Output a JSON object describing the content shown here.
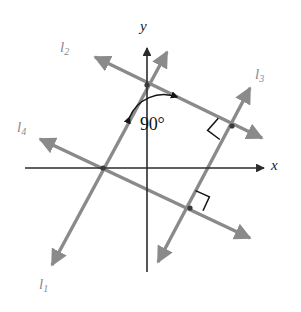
{
  "figure": {
    "kind": "coordinate-geometry-diagram",
    "background_color": "#ffffff",
    "width": 301,
    "height": 312
  },
  "axes": {
    "color": "#333333",
    "x_axis": {
      "label": "x",
      "label_position": {
        "x": 271,
        "y": 157
      },
      "start": {
        "x": 25,
        "y": 168
      },
      "end": {
        "x": 264,
        "y": 168
      },
      "arrow_at_end": true
    },
    "y_axis": {
      "label": "y",
      "label_position": {
        "x": 140,
        "y": 18
      },
      "start": {
        "x": 147,
        "y": 272
      },
      "end": {
        "x": 147,
        "y": 48
      },
      "arrow_at_end": true
    },
    "origin": {
      "x": 147,
      "y": 168
    }
  },
  "lines": [
    {
      "id": "l1",
      "label": "l",
      "subscript": "1",
      "color": "#8a8a8a",
      "label_position": {
        "x": 39,
        "y": 276
      },
      "from": {
        "x": 167,
        "y": 52
      },
      "to": {
        "x": 52,
        "y": 265
      },
      "arrow_both_ends": true
    },
    {
      "id": "l2",
      "label": "l",
      "subscript": "2",
      "color": "#8a8a8a",
      "label_position": {
        "x": 60,
        "y": 39
      },
      "from": {
        "x": 95,
        "y": 57
      },
      "to": {
        "x": 262,
        "y": 138
      },
      "arrow_both_ends": true
    },
    {
      "id": "l3",
      "label": "l",
      "subscript": "3",
      "color": "#8a8a8a",
      "label_position": {
        "x": 255,
        "y": 66
      },
      "from": {
        "x": 250,
        "y": 88
      },
      "to": {
        "x": 158,
        "y": 262
      },
      "arrow_both_ends": true
    },
    {
      "id": "l4",
      "label": "l",
      "subscript": "4",
      "color": "#8a8a8a",
      "label_position": {
        "x": 17,
        "y": 119
      },
      "from": {
        "x": 40,
        "y": 139
      },
      "to": {
        "x": 250,
        "y": 238
      },
      "arrow_both_ends": true
    }
  ],
  "intersection_points": [
    {
      "name": "l1-l2-on-y-axis",
      "x": 147,
      "y": 85,
      "dot": true
    },
    {
      "name": "l1-l4-on-x-axis",
      "x": 103,
      "y": 168,
      "dot": true
    },
    {
      "name": "l2-l3",
      "x": 232,
      "y": 126,
      "dot": true
    },
    {
      "name": "l3-l4",
      "x": 190,
      "y": 208,
      "dot": true
    }
  ],
  "angle_markers": [
    {
      "name": "angle-90-l1-l2",
      "type": "arc",
      "text": "90°",
      "vertex": {
        "x": 147,
        "y": 85
      },
      "text_position": {
        "x": 140,
        "y": 114
      },
      "arrow_on_arc": true,
      "color": "#141414"
    },
    {
      "name": "right-angle-l2-l3",
      "type": "square",
      "text": "",
      "at": {
        "x": 232,
        "y": 126
      },
      "color": "#141414"
    },
    {
      "name": "right-angle-l3-l4",
      "type": "square",
      "text": "",
      "at": {
        "x": 190,
        "y": 208
      },
      "color": "#141414"
    }
  ]
}
